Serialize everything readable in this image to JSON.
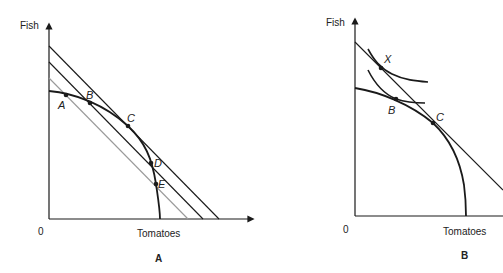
{
  "panels": [
    {
      "caption": "A",
      "y_axis_label": "Fish",
      "x_axis_label": "Tomatoes",
      "origin_label": "0",
      "points": [
        "A",
        "B",
        "C",
        "D",
        "E"
      ],
      "curves": [
        "production-possibility-frontier",
        "price-line-outer",
        "price-line-middle",
        "price-line-inner"
      ]
    },
    {
      "caption": "B",
      "y_axis_label": "Fish",
      "x_axis_label": "Tomatoes",
      "origin_label": "0",
      "points": [
        "X",
        "B",
        "C"
      ],
      "curves": [
        "production-possibility-frontier",
        "world-price-line",
        "indifference-curve-upper",
        "indifference-curve-lower"
      ]
    }
  ],
  "colors": {
    "line": "#1a1a1a",
    "light_line": "#9a9a9a"
  }
}
